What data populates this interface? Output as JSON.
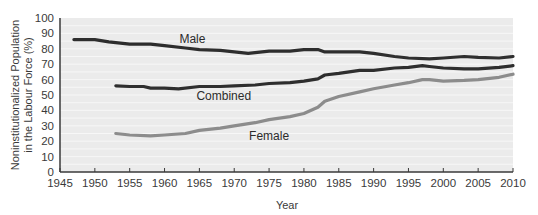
{
  "chart_data": {
    "type": "line",
    "title": "",
    "xlabel": "Year",
    "ylabel": "Noninstitutionalized Population in the Labour Force (%)",
    "ylabel_lines": [
      "Noninstitutionalized Population",
      "in the Labour Force (%)"
    ],
    "xlim": [
      1945,
      2010
    ],
    "ylim": [
      0,
      100
    ],
    "x_ticks": [
      1945,
      1950,
      1955,
      1960,
      1965,
      1970,
      1975,
      1980,
      1985,
      1990,
      1995,
      2000,
      2005,
      2010
    ],
    "y_ticks": [
      0,
      10,
      20,
      30,
      40,
      50,
      60,
      70,
      80,
      90,
      100
    ],
    "grid": true,
    "legend": "inline labels",
    "series": [
      {
        "name": "Male",
        "color": "#2e2e2e",
        "label_pos": {
          "x": 1964,
          "y": 84
        },
        "points": [
          [
            1947,
            86
          ],
          [
            1950,
            86
          ],
          [
            1952,
            84.5
          ],
          [
            1955,
            83
          ],
          [
            1958,
            83
          ],
          [
            1960,
            82
          ],
          [
            1963,
            80.5
          ],
          [
            1965,
            79.5
          ],
          [
            1968,
            79
          ],
          [
            1970,
            78
          ],
          [
            1972,
            77
          ],
          [
            1975,
            78.5
          ],
          [
            1978,
            78.5
          ],
          [
            1980,
            79.5
          ],
          [
            1982,
            79.5
          ],
          [
            1983,
            78
          ],
          [
            1985,
            78
          ],
          [
            1988,
            78
          ],
          [
            1990,
            77
          ],
          [
            1993,
            75
          ],
          [
            1995,
            74
          ],
          [
            1998,
            73.5
          ],
          [
            2000,
            74
          ],
          [
            2003,
            75
          ],
          [
            2005,
            74.5
          ],
          [
            2008,
            74
          ],
          [
            2010,
            75
          ]
        ]
      },
      {
        "name": "Combined",
        "color": "#2e2e2e",
        "label_pos": {
          "x": 1968.5,
          "y": 47
        },
        "points": [
          [
            1953,
            56
          ],
          [
            1955,
            55.5
          ],
          [
            1957,
            55.5
          ],
          [
            1958,
            54.5
          ],
          [
            1960,
            54.5
          ],
          [
            1962,
            54
          ],
          [
            1965,
            55.5
          ],
          [
            1968,
            55.5
          ],
          [
            1970,
            56
          ],
          [
            1973,
            56.5
          ],
          [
            1975,
            57.5
          ],
          [
            1978,
            58
          ],
          [
            1980,
            59
          ],
          [
            1982,
            60.5
          ],
          [
            1983,
            63
          ],
          [
            1985,
            64
          ],
          [
            1988,
            66
          ],
          [
            1990,
            66
          ],
          [
            1993,
            67.5
          ],
          [
            1995,
            68
          ],
          [
            1997,
            69
          ],
          [
            1998,
            68.5
          ],
          [
            2000,
            67.5
          ],
          [
            2003,
            67
          ],
          [
            2005,
            67
          ],
          [
            2008,
            68
          ],
          [
            2010,
            69
          ]
        ]
      },
      {
        "name": "Female",
        "color": "#8c8c8c",
        "label_pos": {
          "x": 1975,
          "y": 20.5
        },
        "points": [
          [
            1953,
            25
          ],
          [
            1955,
            24
          ],
          [
            1958,
            23.5
          ],
          [
            1960,
            24
          ],
          [
            1963,
            25
          ],
          [
            1965,
            27
          ],
          [
            1968,
            28.5
          ],
          [
            1970,
            30
          ],
          [
            1973,
            32
          ],
          [
            1975,
            34
          ],
          [
            1978,
            36
          ],
          [
            1980,
            38
          ],
          [
            1982,
            42
          ],
          [
            1983,
            46
          ],
          [
            1985,
            49
          ],
          [
            1988,
            52
          ],
          [
            1990,
            54
          ],
          [
            1993,
            56.5
          ],
          [
            1995,
            58
          ],
          [
            1997,
            60
          ],
          [
            1998,
            60
          ],
          [
            2000,
            59
          ],
          [
            2003,
            59.5
          ],
          [
            2005,
            60
          ],
          [
            2008,
            61.5
          ],
          [
            2010,
            63.5
          ]
        ]
      }
    ]
  },
  "colors": {
    "plot_background": "#ebebeb",
    "gridline": "#f7f7f7",
    "axis": "#3a3a3a"
  }
}
